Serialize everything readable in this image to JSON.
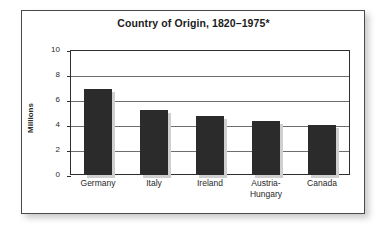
{
  "chart_data": {
    "type": "bar",
    "title": "Country of Origin, 1820–1975*",
    "xlabel": "",
    "ylabel": "Millions",
    "categories": [
      "Germany",
      "Italy",
      "Ireland",
      "Austria-Hungary",
      "Canada"
    ],
    "values": [
      6.9,
      5.2,
      4.7,
      4.3,
      4.0
    ],
    "ylim": [
      0,
      10
    ],
    "yticks": [
      0,
      2,
      4,
      6,
      8,
      10
    ],
    "ytick_labels": [
      "0",
      "2",
      "4",
      "6",
      "8",
      "10"
    ],
    "grid": true,
    "legend": false,
    "bar_color": "#2b2b2b",
    "frame_color": "#4a4a4a",
    "gridline_color": "#6d6d6d"
  },
  "category_display": [
    {
      "line1": "Germany",
      "line2": ""
    },
    {
      "line1": "Italy",
      "line2": ""
    },
    {
      "line1": "Ireland",
      "line2": ""
    },
    {
      "line1": "Austria-",
      "line2": "Hungary"
    },
    {
      "line1": "Canada",
      "line2": ""
    }
  ]
}
